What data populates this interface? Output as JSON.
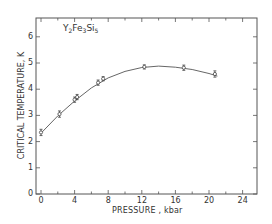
{
  "chart_data": {
    "type": "scatter",
    "title": "Y2Fe3Si5",
    "title_parts": {
      "Y": "Y",
      "n1": "2",
      "Fe": "Fe",
      "n2": "3",
      "Si": "Si",
      "n3": "5"
    },
    "xlabel": "PRESSURE , kbar",
    "ylabel": "CRITICAL TEMPERATURE, K",
    "xlim": [
      -0.5,
      25.5
    ],
    "ylim": [
      0,
      6.6
    ],
    "x_ticks": [
      0,
      4,
      8,
      12,
      16,
      20,
      24
    ],
    "x_tick_labels": [
      "0",
      "4",
      "8",
      "12",
      "16",
      "20",
      "24"
    ],
    "x_minor_step": 2,
    "y_ticks": [
      0,
      1,
      2,
      3,
      4,
      5,
      6
    ],
    "y_tick_labels": [
      "0",
      "1",
      "2",
      "3",
      "4",
      "5",
      "6"
    ],
    "grid": false,
    "legend": null,
    "series": [
      {
        "name": "Y2Fe3Si5",
        "marker": "open-circle",
        "x": [
          0.0,
          2.2,
          4.0,
          4.3,
          6.8,
          7.4,
          12.3,
          17.0,
          20.7
        ],
        "y": [
          2.35,
          3.05,
          3.6,
          3.7,
          4.25,
          4.4,
          4.85,
          4.82,
          4.58
        ],
        "yerr": [
          0.12,
          0.12,
          0.1,
          0.1,
          0.1,
          0.08,
          0.08,
          0.1,
          0.12
        ]
      }
    ],
    "fit_curve": {
      "x": [
        0,
        2,
        4,
        6,
        8,
        10,
        12,
        14,
        16,
        18,
        20,
        21
      ],
      "y": [
        2.32,
        2.98,
        3.55,
        4.05,
        4.43,
        4.68,
        4.83,
        4.88,
        4.84,
        4.75,
        4.6,
        4.5
      ]
    }
  }
}
